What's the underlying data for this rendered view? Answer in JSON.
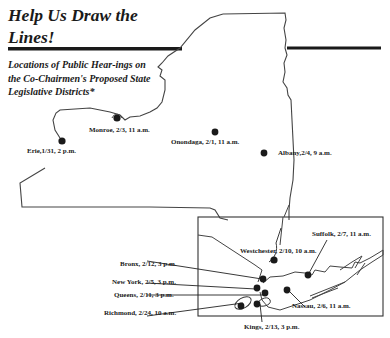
{
  "title": {
    "line1": "Help Us Draw the",
    "line2": "Lines!"
  },
  "subtitle": "Locations of Public Hear-ings on the Co-Chairmen's Proposed State Legislative Districts*",
  "colors": {
    "ink": "#1a1a1a",
    "outline": "#444444",
    "background": "#ffffff"
  },
  "hearings": {
    "upstate": [
      {
        "county": "Monroe",
        "label": "Monroe, 2/3, 11 a.m."
      },
      {
        "county": "Erie",
        "label": "Erie,1/31, 2 p.m."
      },
      {
        "county": "Onondaga",
        "label": "Onondaga, 2/1, 11 a.m."
      },
      {
        "county": "Albany",
        "label": "Albany,2/4, 9 a.m."
      }
    ],
    "inset": [
      {
        "county": "Suffolk",
        "label": "Suffolk, 2/7, 11 a.m."
      },
      {
        "county": "Westchester",
        "label": "Westchester, 2/10, 10 a.m."
      },
      {
        "county": "Bronx",
        "label": "Bronx, 2/12, 3 p.m."
      },
      {
        "county": "New York",
        "label": "New York, 2/5, 3 p.m."
      },
      {
        "county": "Queens",
        "label": "Queens, 2/11, 3 p.m."
      },
      {
        "county": "Nassau",
        "label": "Nassau, 2/6, 11 a.m."
      },
      {
        "county": "Richmond",
        "label": "Richmond, 2/24, 10 a.m."
      },
      {
        "county": "Kings",
        "label": "Kings, 2/13, 3 p.m."
      }
    ]
  },
  "marker_icon": "starburst-dot"
}
